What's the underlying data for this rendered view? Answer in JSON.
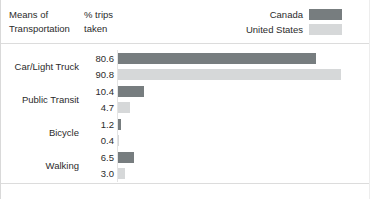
{
  "header": {
    "col_category": "Means of\nTransportation",
    "col_value": "% trips\ntaken"
  },
  "legend": {
    "position": "top-right",
    "entries": [
      {
        "label": "Canada",
        "color": "#777d7f",
        "swatch_name": "legend-swatch-canada"
      },
      {
        "label": "United States",
        "color": "#d6d8d9",
        "swatch_name": "legend-swatch-united-states"
      }
    ]
  },
  "chart_data": {
    "type": "bar",
    "orientation": "horizontal",
    "title": "",
    "subtitle": "",
    "xlabel": "% trips taken",
    "ylabel": "Means of Transportation",
    "categories": [
      "Car/Light Truck",
      "Public Transit",
      "Bicycle",
      "Walking"
    ],
    "series": [
      {
        "name": "Canada",
        "color": "#777d7f",
        "values": [
          80.6,
          10.4,
          1.2,
          6.5
        ]
      },
      {
        "name": "United States",
        "color": "#d6d8d9",
        "values": [
          90.8,
          4.7,
          0.4,
          3.0
        ]
      }
    ],
    "value_labels": [
      [
        "80.6",
        "90.8"
      ],
      [
        "10.4",
        "4.7"
      ],
      [
        "1.2",
        "0.4"
      ],
      [
        "6.5",
        "3.0"
      ]
    ],
    "xlim": [
      0,
      90.8
    ],
    "grid": false,
    "legend_position": "top-right",
    "axis_ticks_visible": false
  },
  "style": {
    "background": "#ffffff",
    "text_color": "#2b2b2b",
    "rule_color": "#dcdcdc",
    "axis_color": "#e4e4e4",
    "bar_max_px": 223
  }
}
